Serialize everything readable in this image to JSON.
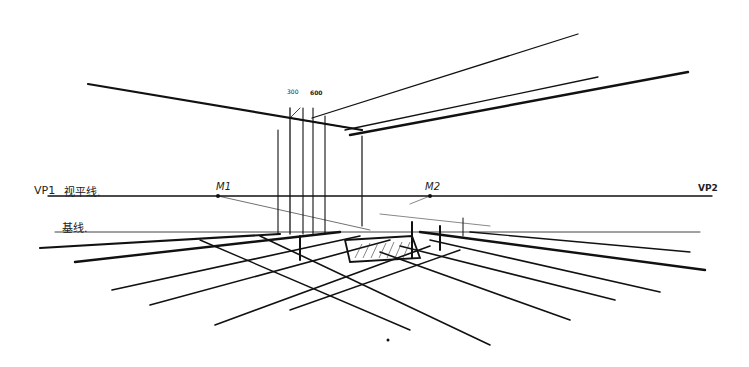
{
  "labels": {
    "vp1": "VP1",
    "horizon": "视平线.",
    "m1": "M1",
    "m2": "M2",
    "vp2": "VP2",
    "ground": "基线.",
    "dim1": "300",
    "dim2": "600"
  },
  "colors": {
    "ink": "#111111",
    "paper": "#ffffff"
  }
}
